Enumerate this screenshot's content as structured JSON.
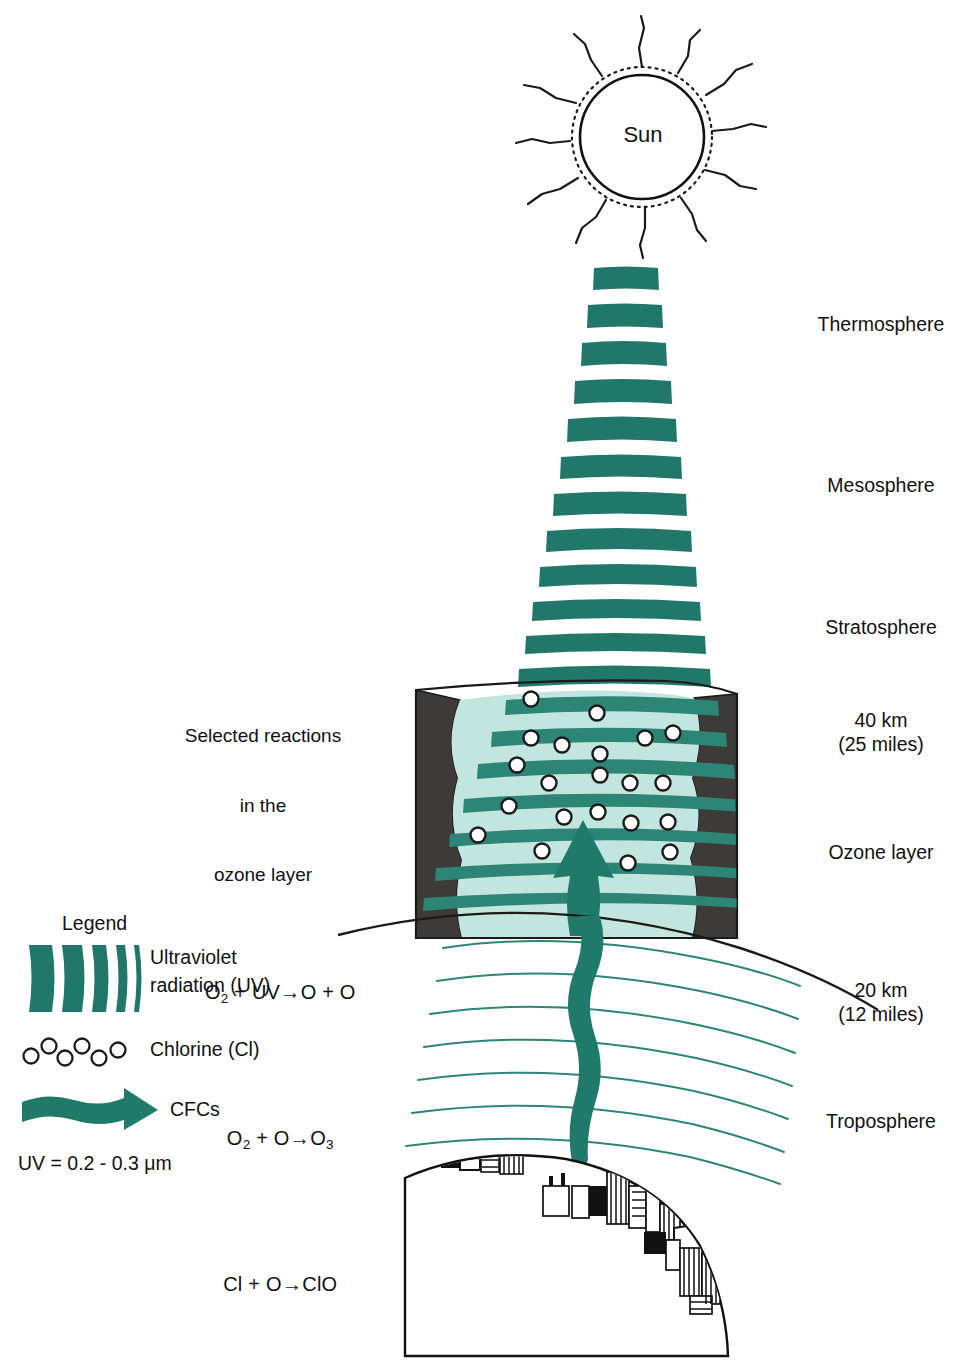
{
  "title_elements": {
    "sun_label": "Sun"
  },
  "colors": {
    "teal": "#21786a",
    "teal_light": "#2d8576",
    "ozone_fill": "#c2e6df",
    "rock_dark": "#3d3a38",
    "line_black": "#111111",
    "white": "#ffffff"
  },
  "atmosphere_labels": [
    {
      "name": "thermosphere",
      "text": "Thermosphere",
      "x": 808,
      "y": 313
    },
    {
      "name": "mesosphere",
      "text": "Mesosphere",
      "x": 817,
      "y": 474
    },
    {
      "name": "stratosphere",
      "text": "Stratosphere",
      "x": 814,
      "y": 616
    },
    {
      "name": "altitude-40km",
      "text": "40 km\n(25 miles)",
      "x": 830,
      "y": 709
    },
    {
      "name": "ozone-layer",
      "text": "Ozone layer",
      "x": 820,
      "y": 841
    },
    {
      "name": "altitude-20km",
      "text": "20 km\n(12 miles)",
      "x": 830,
      "y": 979
    },
    {
      "name": "troposphere",
      "text": "Troposphere",
      "x": 816,
      "y": 1110
    }
  ],
  "reactions": {
    "heading_line1": "Selected reactions",
    "heading_line2": "in the",
    "heading_line3": "ozone layer",
    "equations": [
      {
        "left": "O",
        "left_sub": "2",
        "left_rest": " + UV",
        "arrow": "→",
        "right": "O + O",
        "right_sub": ""
      },
      {
        "left": "O",
        "left_sub": "2",
        "left_rest": " + O",
        "arrow": "→",
        "right": "O",
        "right_sub": "3"
      },
      {
        "left": "Cl",
        "left_sub": "",
        "left_rest": " + O",
        "arrow": "→",
        "right": "ClO",
        "right_sub": ""
      }
    ],
    "equation_text": [
      "O2 + UV→O + O",
      "O2 + O→O3",
      "Cl + O→ClO"
    ]
  },
  "legend": {
    "title": "Legend",
    "items": [
      {
        "name": "uv-radiation",
        "icon": "uv-bars-icon",
        "label_line1": "Ultraviolet",
        "label_line2": "radiation (UV)"
      },
      {
        "name": "chlorine",
        "icon": "chlorine-circles-icon",
        "label_line1": "Chlorine (Cl)",
        "label_line2": ""
      },
      {
        "name": "cfcs",
        "icon": "cfc-arrow-icon",
        "label_line1": "CFCs",
        "label_line2": ""
      }
    ],
    "footnote": "UV = 0.2 - 0.3 μm"
  },
  "chart_data": {
    "type": "diagram",
    "uv_beam": {
      "description": "Cone of horizontal teal bars of ultraviolet radiation descending from the Sun, widening toward the ozone layer",
      "bar_count_above_ozone": 16,
      "bar_count_in_ozone": 7,
      "top_y": 268,
      "top_width": 66,
      "bottom_y": 905,
      "bottom_width": 300
    },
    "ozone_block": {
      "left_x": 416,
      "right_x": 736,
      "top_y": 686,
      "bottom_y": 938,
      "chlorine_atom_count": 24
    },
    "earth": {
      "description": "Curved earth horizon with three city skylines",
      "city_clusters": 3
    },
    "uv_wavelength_um": [
      0.2,
      0.3
    ],
    "altitudes_km": [
      20,
      40
    ],
    "altitudes_miles": [
      12,
      25
    ]
  }
}
